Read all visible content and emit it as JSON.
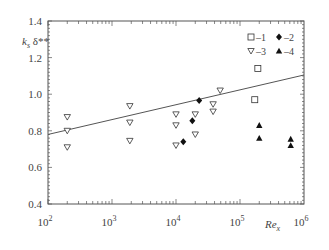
{
  "chart_data": {
    "type": "scatter",
    "title": "",
    "xlabel": "Re_x",
    "ylabel": "k_s δ**",
    "xscale": "log",
    "xlim": [
      100,
      1000000
    ],
    "ylim": [
      0.4,
      1.4
    ],
    "x_ticks": [
      100,
      1000,
      10000,
      100000,
      1000000
    ],
    "x_tick_labels": [
      "10^2",
      "10^3",
      "10^4",
      "10^5",
      "10^6"
    ],
    "y_ticks": [
      0.4,
      0.6,
      0.8,
      1.0,
      1.2,
      1.4
    ],
    "y_tick_labels": [
      "0.4",
      "0.6",
      "0.8",
      "1.0",
      "1.2",
      "1.4"
    ],
    "grid": false,
    "legend_position": "upper right (inside)",
    "series": [
      {
        "name": "1",
        "marker": "open-square",
        "points": [
          [
            170000,
            0.97
          ],
          [
            190000,
            1.14
          ]
        ]
      },
      {
        "name": "2",
        "marker": "filled-diamond",
        "points": [
          [
            13000,
            0.74
          ],
          [
            18000,
            0.855
          ],
          [
            23000,
            0.965
          ]
        ]
      },
      {
        "name": "3",
        "marker": "open-down-triangle",
        "points": [
          [
            200,
            0.875
          ],
          [
            200,
            0.8
          ],
          [
            200,
            0.71
          ],
          [
            1900,
            0.935
          ],
          [
            1900,
            0.845
          ],
          [
            1900,
            0.745
          ],
          [
            10000,
            0.89
          ],
          [
            10000,
            0.83
          ],
          [
            10000,
            0.72
          ],
          [
            20000,
            0.89
          ],
          [
            20000,
            0.78
          ],
          [
            38000,
            0.945
          ],
          [
            38000,
            0.905
          ],
          [
            49000,
            1.02
          ]
        ]
      },
      {
        "name": "4",
        "marker": "filled-up-triangle",
        "points": [
          [
            200000,
            0.83
          ],
          [
            200000,
            0.76
          ],
          [
            620000,
            0.755
          ],
          [
            620000,
            0.72
          ]
        ]
      },
      {
        "name": "fit",
        "marker": "line",
        "points": [
          [
            100,
            0.78
          ],
          [
            1000000,
            1.105
          ]
        ]
      }
    ]
  },
  "labels": {
    "ylabel_main": "k",
    "ylabel_sub": "s",
    "ylabel_rest": " δ**",
    "xlabel_main": "Re",
    "xlabel_sub": "x",
    "legend": [
      "–1",
      "–2",
      "–3",
      "–4"
    ]
  }
}
